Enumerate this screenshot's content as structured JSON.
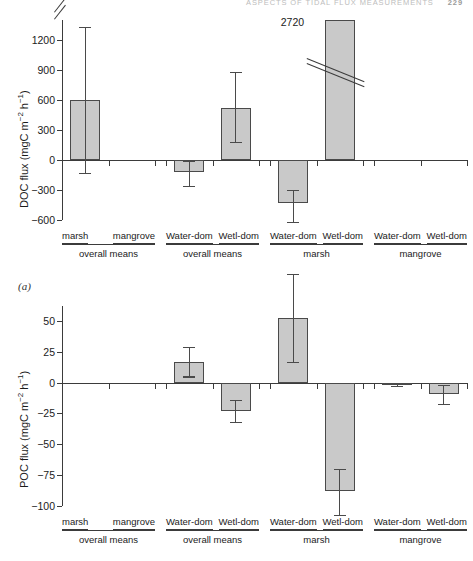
{
  "running_head": {
    "text": "ASPECTS OF TIDAL FLUX MEASUREMENTS",
    "page_number": "229"
  },
  "panel_letter": "(a)",
  "axis_categories": {
    "groups": [
      {
        "group_label": "overall means",
        "categories": [
          "marsh",
          "mangrove"
        ]
      },
      {
        "group_label": "overall means",
        "categories": [
          "Water-dom",
          "Wetl-dom"
        ]
      },
      {
        "group_label": "marsh",
        "categories": [
          "Water-dom",
          "Wetl-dom"
        ]
      },
      {
        "group_label": "mangrove",
        "categories": [
          "Water-dom",
          "Wetl-dom"
        ]
      }
    ]
  },
  "chart_data": [
    {
      "type": "bar",
      "id": "doc-flux",
      "title": "",
      "xlabel": "",
      "ylabel": "DOC flux (mgC m⁻² h⁻¹)",
      "ylim": [
        -600,
        1400
      ],
      "yticks": [
        1200,
        900,
        600,
        300,
        0,
        -300,
        -600
      ],
      "ytick_labels": [
        "1200",
        "900",
        "600",
        "300",
        "0",
        "−300",
        "−600"
      ],
      "axis_break": true,
      "axis_break_above": 1200,
      "grid": false,
      "legend": "none",
      "categories": [
        "marsh (overall means)",
        "mangrove (overall means)",
        "Water-dom (overall means)",
        "Wetl-dom (overall means)",
        "Water-dom (marsh)",
        "Wetl-dom (marsh)",
        "Water-dom (mangrove)",
        "Wetl-dom (mangrove)"
      ],
      "values": [
        600,
        null,
        -120,
        520,
        -430,
        2720,
        null,
        null
      ],
      "error_low": [
        -130,
        null,
        -255,
        180,
        -615,
        null,
        null,
        null
      ],
      "error_high": [
        1330,
        null,
        -10,
        880,
        -300,
        null,
        null,
        null
      ],
      "truncated_bars": [
        {
          "category": "Wetl-dom (marsh)",
          "value": 2720,
          "value_label": "2720",
          "break_mark": true
        }
      ]
    },
    {
      "type": "bar",
      "id": "poc-flux",
      "title": "",
      "xlabel": "",
      "ylabel": "POC flux (mgC m⁻² h⁻¹)",
      "ylim": [
        -100,
        62
      ],
      "yticks": [
        50,
        25,
        0,
        -25,
        -50,
        -75,
        -100
      ],
      "ytick_labels": [
        "50",
        "25",
        "0",
        "−25",
        "−50",
        "−75",
        "−100"
      ],
      "axis_break": false,
      "grid": false,
      "legend": "none",
      "categories": [
        "marsh (overall means)",
        "mangrove (overall means)",
        "Water-dom (overall means)",
        "Wetl-dom (overall means)",
        "Water-dom (marsh)",
        "Wetl-dom (marsh)",
        "Water-dom (mangrove)",
        "Wetl-dom (mangrove)"
      ],
      "values": [
        null,
        null,
        17,
        -23,
        52,
        -88,
        -1.5,
        -9
      ],
      "error_low": [
        null,
        null,
        5,
        -32,
        17,
        -107,
        -3,
        -17
      ],
      "error_high": [
        null,
        null,
        29,
        -14,
        88,
        -70,
        0,
        -2
      ]
    }
  ]
}
